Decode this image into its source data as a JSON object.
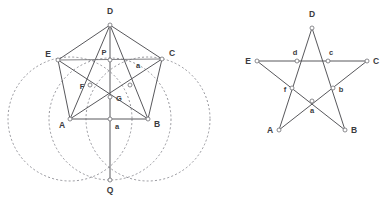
{
  "figure": {
    "background_color": "#ffffff",
    "line_color": "#58585c",
    "dashed_color": "#7c7c84",
    "node_fill": "#ffffff"
  },
  "left_diagram": {
    "name": "pentagon-construction",
    "vertices": [
      {
        "id": "D",
        "label": "D",
        "x": 110,
        "y": 25,
        "label_x": 110,
        "label_y": 14,
        "anchor": "middle"
      },
      {
        "id": "E",
        "label": "E",
        "x": 58,
        "y": 60,
        "label_x": 48,
        "label_y": 57,
        "anchor": "middle"
      },
      {
        "id": "C",
        "label": "C",
        "x": 162,
        "y": 59,
        "label_x": 172,
        "label_y": 56,
        "anchor": "middle"
      },
      {
        "id": "A",
        "label": "A",
        "x": 70,
        "y": 119,
        "label_x": 62,
        "label_y": 128,
        "anchor": "middle"
      },
      {
        "id": "B",
        "label": "B",
        "x": 148,
        "y": 119,
        "label_x": 157,
        "label_y": 127,
        "anchor": "middle"
      },
      {
        "id": "Q",
        "label": "Q",
        "x": 110,
        "y": 180,
        "label_x": 110,
        "label_y": 193,
        "anchor": "middle"
      },
      {
        "id": "P",
        "label": "P",
        "x": 110,
        "y": 60,
        "label_x": 104,
        "label_y": 55,
        "anchor": "middle"
      },
      {
        "id": "F",
        "label": "F",
        "x": 90,
        "y": 85,
        "label_x": 82,
        "label_y": 89,
        "anchor": "middle"
      },
      {
        "id": "G",
        "label": "G",
        "x": 110,
        "y": 97,
        "label_x": 119,
        "label_y": 101,
        "anchor": "middle"
      },
      {
        "id": "H",
        "label": "",
        "x": 130,
        "y": 85,
        "label_x": 130,
        "label_y": 85,
        "anchor": "middle"
      },
      {
        "id": "M",
        "label": "",
        "x": 110,
        "y": 119,
        "label_x": 110,
        "label_y": 119,
        "anchor": "middle"
      }
    ],
    "segment_labels": [
      {
        "id": "a-side-ac",
        "text": "a",
        "x": 138,
        "y": 68
      },
      {
        "id": "a-side-ab",
        "text": "a",
        "x": 117,
        "y": 129
      }
    ],
    "circles": [
      {
        "id": "circle-center-A",
        "cx": 70,
        "cy": 119,
        "r": 62,
        "style": "dashed"
      },
      {
        "id": "circle-center-B",
        "cx": 148,
        "cy": 119,
        "r": 62,
        "style": "dashed"
      },
      {
        "id": "circle-upper",
        "cx": 110,
        "cy": 119,
        "r": 61,
        "style": "dashed"
      }
    ],
    "solid_edges": [
      [
        "D",
        "E"
      ],
      [
        "D",
        "C"
      ],
      [
        "E",
        "A"
      ],
      [
        "C",
        "B"
      ],
      [
        "A",
        "B"
      ],
      [
        "D",
        "A"
      ],
      [
        "D",
        "B"
      ],
      [
        "E",
        "B"
      ],
      [
        "C",
        "A"
      ],
      [
        "E",
        "C"
      ],
      [
        "D",
        "Q"
      ]
    ]
  },
  "right_diagram": {
    "name": "pentagram",
    "vertices": [
      {
        "id": "D",
        "label": "D",
        "x": 312,
        "y": 28,
        "label_x": 312,
        "label_y": 17,
        "anchor": "middle"
      },
      {
        "id": "E",
        "label": "E",
        "x": 257,
        "y": 61,
        "label_x": 248,
        "label_y": 59,
        "anchor": "middle"
      },
      {
        "id": "C",
        "label": "C",
        "x": 367,
        "y": 61,
        "label_x": 376,
        "label_y": 59,
        "anchor": "middle"
      },
      {
        "id": "A",
        "label": "A",
        "x": 279,
        "y": 130,
        "label_x": 270,
        "label_y": 129,
        "anchor": "middle"
      },
      {
        "id": "B",
        "label": "B",
        "x": 345,
        "y": 130,
        "label_x": 354,
        "label_y": 129,
        "anchor": "middle"
      },
      {
        "id": "d",
        "label": "d",
        "x": 297,
        "y": 61,
        "label_x": 295,
        "label_y": 54,
        "anchor": "middle"
      },
      {
        "id": "c",
        "label": "c",
        "x": 328,
        "y": 61,
        "label_x": 330,
        "label_y": 54,
        "anchor": "middle"
      },
      {
        "id": "f",
        "label": "f",
        "x": 292,
        "y": 88,
        "label_x": 285,
        "label_y": 92,
        "anchor": "middle"
      },
      {
        "id": "b",
        "label": "b",
        "x": 333,
        "y": 88,
        "label_x": 341,
        "label_y": 92,
        "anchor": "middle"
      },
      {
        "id": "a",
        "label": "a",
        "x": 312,
        "y": 101,
        "label_x": 312,
        "label_y": 113,
        "anchor": "middle"
      }
    ],
    "solid_edges": [
      [
        "A",
        "C"
      ],
      [
        "C",
        "f"
      ],
      [
        "f",
        "A"
      ],
      [
        "E",
        "B"
      ],
      [
        "B",
        "d"
      ],
      [
        "d",
        "E"
      ],
      [
        "D",
        "a"
      ],
      [
        "a",
        "D"
      ],
      [
        "D",
        "A"
      ],
      [
        "D",
        "B"
      ],
      [
        "E",
        "C"
      ]
    ],
    "star_path": [
      "A",
      "C",
      "E",
      "B",
      "D",
      "A"
    ]
  }
}
